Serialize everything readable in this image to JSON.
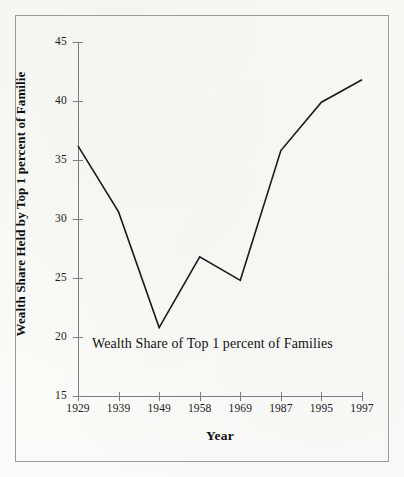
{
  "figure": {
    "background_color": "#fbfbf9",
    "border_color": "#9a9a9a",
    "line_color": "#1a1a1a",
    "axis_color": "#7d7d7d"
  },
  "chart_data": {
    "type": "line",
    "title": "",
    "annotation": "Wealth Share of Top 1 percent of Families",
    "xlabel": "Year",
    "ylabel": "Wealth Share Held by Top 1 percent of Familie",
    "categories": [
      "1929",
      "1939",
      "1949",
      "1958",
      "1969",
      "1987",
      "1995",
      "1997"
    ],
    "values": [
      36.2,
      30.6,
      20.8,
      26.8,
      24.8,
      35.8,
      39.9,
      41.8
    ],
    "ylim": [
      15,
      45
    ],
    "yticks": [
      "45",
      "40",
      "35",
      "30",
      "25",
      "20",
      "15"
    ],
    "ytick_values": [
      45,
      40,
      35,
      30,
      25,
      20,
      15
    ],
    "grid": false,
    "legend": "none",
    "series": [
      {
        "name": "Wealth Share of Top 1 percent of Families",
        "values": [
          36.2,
          30.6,
          20.8,
          26.8,
          24.8,
          35.8,
          39.9,
          41.8
        ]
      }
    ]
  }
}
